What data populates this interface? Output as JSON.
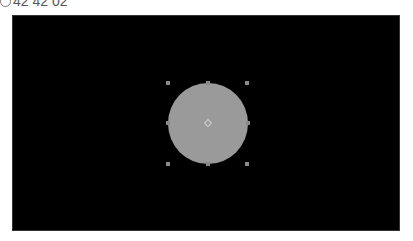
{
  "header": {
    "time_label": "42 42 02",
    "icon": "clock-icon"
  },
  "canvas": {
    "background": "#000000",
    "shape": {
      "type": "circle",
      "fill": "#9a9a9a",
      "selected": true
    }
  }
}
